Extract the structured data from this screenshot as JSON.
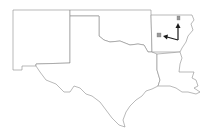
{
  "map": {
    "region": "South Central United States",
    "states": [
      "New Mexico",
      "Texas",
      "Oklahoma",
      "Arkansas",
      "Louisiana"
    ],
    "colors": {
      "state_fill": "#ffffff",
      "state_border": "#8a8a8a",
      "arrow": "#1a1a1a",
      "marker": "#9a9a9a"
    },
    "markers": [
      {
        "name": "northern-marker",
        "x": 179,
        "y": 19
      },
      {
        "name": "western-marker",
        "x": 159,
        "y": 35
      }
    ],
    "arrows": [
      {
        "name": "arrow-north",
        "direction": "north"
      },
      {
        "name": "arrow-west",
        "direction": "west"
      }
    ]
  }
}
